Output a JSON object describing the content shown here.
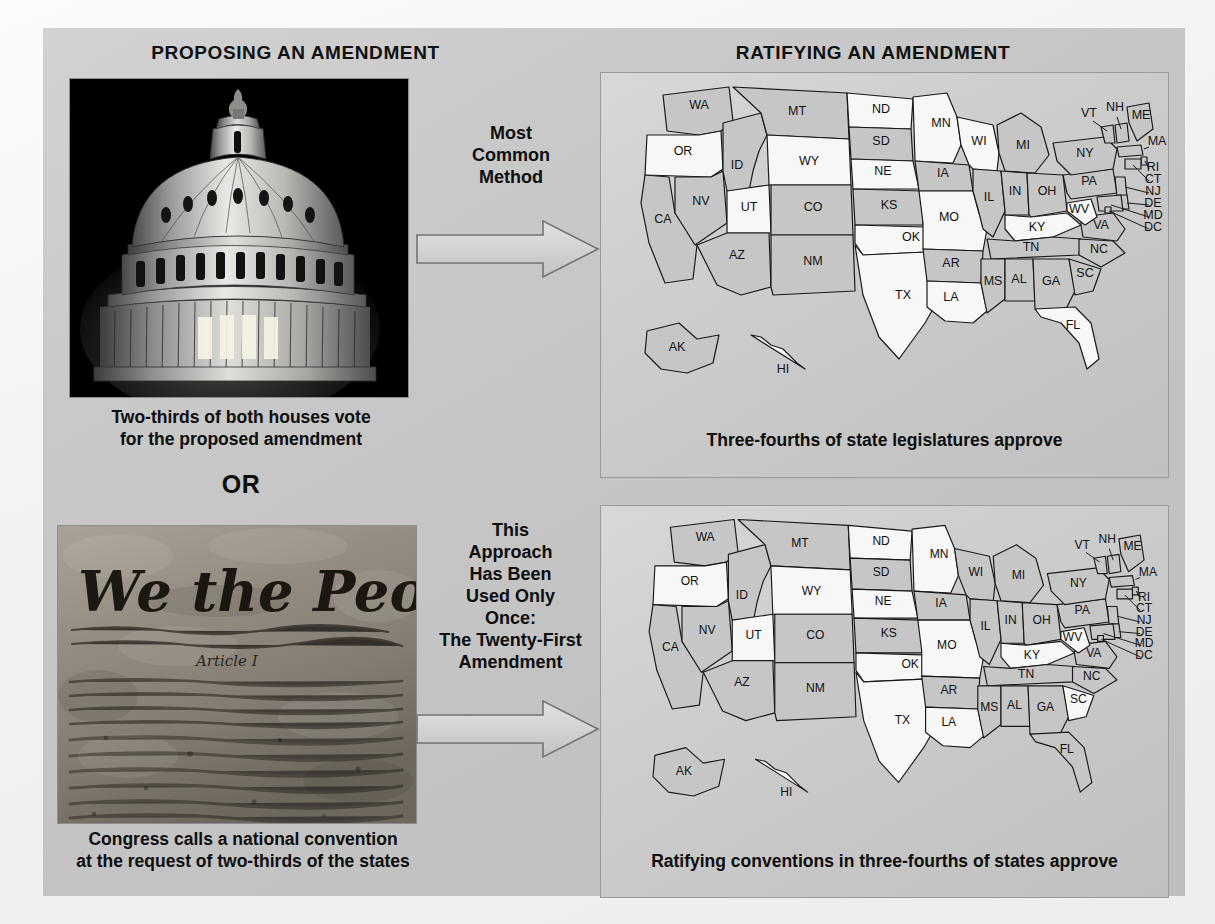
{
  "headers": {
    "left": "PROPOSING AN AMENDMENT",
    "right": "RATIFYING AN AMENDMENT"
  },
  "left_column": {
    "capitol_photo_alt": "United States Capitol dome at night",
    "caption_1_line_1": "Two-thirds of both houses vote",
    "caption_1_line_2": "for the proposed amendment",
    "or": "OR",
    "constitution_photo_alt": "We the People — United States Constitution preamble",
    "constitution_heading": "We the People",
    "constitution_article": "Article I",
    "caption_2_line_1": "Congress calls a national convention",
    "caption_2_line_2": "at the request of two-thirds of the states"
  },
  "arrows": [
    {
      "name": "most-common-method",
      "lines": [
        "Most",
        "Common",
        "Method"
      ]
    },
    {
      "name": "twenty-first-amendment",
      "lines": [
        "This",
        "Approach",
        "Has Been",
        "Used Only",
        "Once:",
        "The Twenty-First",
        "Amendment"
      ]
    }
  ],
  "maps": [
    {
      "id": "legislatures",
      "caption": "Three-fourths of state legislatures approve",
      "shaded_states": [
        "WA",
        "MT",
        "ID",
        "NV",
        "CA",
        "CO",
        "NM",
        "AZ",
        "SD",
        "KS",
        "IA",
        "IL",
        "IN",
        "OH",
        "PA",
        "NY",
        "VA",
        "TN",
        "NC",
        "SC",
        "GA",
        "AL",
        "MS",
        "AR",
        "MI",
        "ME",
        "MD",
        "DE",
        "NJ",
        "CT",
        "RI",
        "MA",
        "NH",
        "VT",
        "DC",
        "AK"
      ],
      "unshaded_states": [
        "OR",
        "WY",
        "UT",
        "ND",
        "NE",
        "OK",
        "TX",
        "MN",
        "WI",
        "MO",
        "LA",
        "KY",
        "WV",
        "FL",
        "HI"
      ],
      "state_labels": [
        "WA",
        "OR",
        "ID",
        "MT",
        "ND",
        "SD",
        "MN",
        "WI",
        "MI",
        "NY",
        "VT",
        "NH",
        "ME",
        "MA",
        "RI",
        "CT",
        "NJ",
        "DE",
        "MD",
        "DC",
        "PA",
        "OH",
        "IN",
        "IL",
        "IA",
        "NE",
        "WY",
        "UT",
        "NV",
        "CA",
        "AZ",
        "NM",
        "CO",
        "KS",
        "MO",
        "AR",
        "OK",
        "TX",
        "LA",
        "MS",
        "AL",
        "GA",
        "FL",
        "SC",
        "NC",
        "TN",
        "KY",
        "WV",
        "VA",
        "AK",
        "HI"
      ]
    },
    {
      "id": "conventions",
      "caption": "Ratifying conventions in three-fourths of states approve",
      "shaded_states": [
        "WA",
        "MT",
        "ID",
        "NV",
        "CA",
        "CO",
        "NM",
        "AZ",
        "SD",
        "KS",
        "IA",
        "IL",
        "IN",
        "OH",
        "PA",
        "VA",
        "TN",
        "NC",
        "GA",
        "AL",
        "MS",
        "AR",
        "MI",
        "ME",
        "MD",
        "DE",
        "NJ",
        "CT",
        "RI",
        "MA",
        "NH",
        "VT",
        "DC",
        "AK",
        "WI",
        "FL",
        "NY"
      ],
      "unshaded_states": [
        "OR",
        "WY",
        "UT",
        "ND",
        "NE",
        "OK",
        "TX",
        "MN",
        "MO",
        "LA",
        "KY",
        "WV",
        "SC",
        "HI"
      ],
      "state_labels": [
        "WA",
        "OR",
        "ID",
        "MT",
        "ND",
        "SD",
        "MN",
        "WI",
        "MI",
        "NY",
        "VT",
        "NH",
        "ME",
        "MA",
        "RI",
        "CT",
        "NJ",
        "DE",
        "MD",
        "DC",
        "PA",
        "OH",
        "IN",
        "IL",
        "IA",
        "NE",
        "WY",
        "UT",
        "NV",
        "CA",
        "AZ",
        "NM",
        "CO",
        "KS",
        "MO",
        "AR",
        "OK",
        "TX",
        "LA",
        "MS",
        "AL",
        "GA",
        "FL",
        "SC",
        "NC",
        "TN",
        "KY",
        "WV",
        "VA",
        "AK",
        "HI"
      ]
    }
  ],
  "colors": {
    "panel_bg": "#c8c8c8",
    "map_panel_bg": "#cfcfcf",
    "state_shaded": "#c6c6c6",
    "state_unshaded": "#f7f7f7",
    "outline": "#1a1a1a",
    "text": "#0d0d0d",
    "arrow_fill": "#d3d3d3",
    "arrow_stroke": "#6f6f6f"
  }
}
